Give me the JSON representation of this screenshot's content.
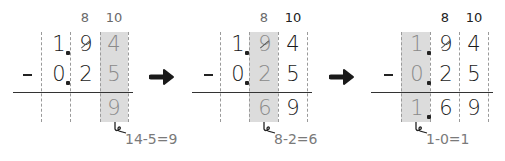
{
  "colors": {
    "shade": "#dcdcdc",
    "ink": "#1a1a1a",
    "muted": "#8a8a8a",
    "line": "#333333"
  },
  "operator": "-",
  "panels": [
    {
      "borrow_marks": [
        "8",
        "10"
      ],
      "top": [
        "1",
        ".",
        "9",
        "4"
      ],
      "bottom": [
        "0",
        ".",
        "2",
        "5"
      ],
      "result": [
        "",
        "",
        "",
        "9"
      ],
      "highlight_column": "hundredths",
      "note": "14-5=9"
    },
    {
      "borrow_marks": [
        "8",
        "10"
      ],
      "top": [
        "1",
        ".",
        "9",
        "4"
      ],
      "bottom": [
        "0",
        ".",
        "2",
        "5"
      ],
      "result": [
        "",
        "",
        "6",
        "9"
      ],
      "highlight_column": "tenths",
      "note": "8-2=6"
    },
    {
      "borrow_marks": [
        "8",
        "10"
      ],
      "top": [
        "1",
        ".",
        "9",
        "4"
      ],
      "bottom": [
        "0",
        ".",
        "2",
        "5"
      ],
      "result": [
        "1",
        ".",
        "6",
        "9"
      ],
      "highlight_column": "ones",
      "note": "1-0=1"
    }
  ],
  "arrows": [
    "right-arrow",
    "right-arrow"
  ]
}
